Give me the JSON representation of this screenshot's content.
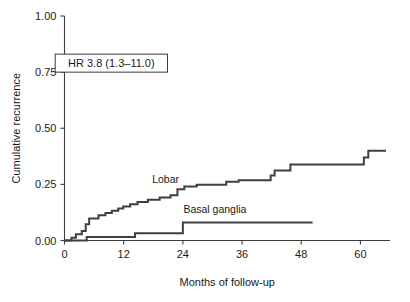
{
  "chart_data": {
    "type": "line",
    "title": "",
    "xlabel": "Months of follow-up",
    "ylabel": "Cumulative recurrence",
    "xlim": [
      0,
      66
    ],
    "ylim": [
      0.0,
      1.0
    ],
    "xticks": [
      0,
      12,
      24,
      36,
      48,
      60
    ],
    "xticklabels": [
      "0",
      "12",
      "24",
      "36",
      "48",
      "60"
    ],
    "yticks": [
      0.0,
      0.25,
      0.5,
      0.75,
      1.0
    ],
    "yticklabels": [
      "0.00",
      "0.25",
      "0.50",
      "0.75",
      "1.00"
    ],
    "grid": false,
    "legend_position": "inline-labels",
    "annotations": [
      {
        "name": "hazard-ratio",
        "text": "HR 3.8 (1.3–11.0)",
        "boxed": true,
        "x_months": 9.5,
        "y_value": 0.79
      }
    ],
    "series": [
      {
        "name": "Lobar",
        "label": "Lobar",
        "label_x_months": 20.5,
        "label_y_value": 0.255,
        "style": "step-post",
        "color": "#3f3f3f",
        "points": [
          {
            "x": 0.0,
            "y": 0.0
          },
          {
            "x": 1.0,
            "y": 0.0
          },
          {
            "x": 1.4,
            "y": 0.012
          },
          {
            "x": 2.0,
            "y": 0.012
          },
          {
            "x": 2.3,
            "y": 0.028
          },
          {
            "x": 3.2,
            "y": 0.028
          },
          {
            "x": 3.5,
            "y": 0.042
          },
          {
            "x": 4.0,
            "y": 0.042
          },
          {
            "x": 4.3,
            "y": 0.072
          },
          {
            "x": 4.8,
            "y": 0.072
          },
          {
            "x": 5.0,
            "y": 0.098
          },
          {
            "x": 6.6,
            "y": 0.098
          },
          {
            "x": 6.9,
            "y": 0.112
          },
          {
            "x": 8.0,
            "y": 0.112
          },
          {
            "x": 8.3,
            "y": 0.122
          },
          {
            "x": 9.3,
            "y": 0.122
          },
          {
            "x": 9.6,
            "y": 0.132
          },
          {
            "x": 10.6,
            "y": 0.132
          },
          {
            "x": 10.9,
            "y": 0.142
          },
          {
            "x": 11.6,
            "y": 0.142
          },
          {
            "x": 11.9,
            "y": 0.152
          },
          {
            "x": 13.0,
            "y": 0.152
          },
          {
            "x": 13.3,
            "y": 0.162
          },
          {
            "x": 14.5,
            "y": 0.162
          },
          {
            "x": 14.8,
            "y": 0.172
          },
          {
            "x": 16.6,
            "y": 0.172
          },
          {
            "x": 16.9,
            "y": 0.182
          },
          {
            "x": 19.0,
            "y": 0.182
          },
          {
            "x": 19.3,
            "y": 0.192
          },
          {
            "x": 21.2,
            "y": 0.192
          },
          {
            "x": 21.5,
            "y": 0.202
          },
          {
            "x": 22.6,
            "y": 0.202
          },
          {
            "x": 22.9,
            "y": 0.228
          },
          {
            "x": 24.0,
            "y": 0.228
          },
          {
            "x": 24.3,
            "y": 0.24
          },
          {
            "x": 26.5,
            "y": 0.24
          },
          {
            "x": 26.8,
            "y": 0.248
          },
          {
            "x": 32.5,
            "y": 0.248
          },
          {
            "x": 32.8,
            "y": 0.262
          },
          {
            "x": 35.0,
            "y": 0.262
          },
          {
            "x": 35.3,
            "y": 0.268
          },
          {
            "x": 41.5,
            "y": 0.268
          },
          {
            "x": 41.8,
            "y": 0.29
          },
          {
            "x": 42.3,
            "y": 0.29
          },
          {
            "x": 42.6,
            "y": 0.312
          },
          {
            "x": 45.5,
            "y": 0.312
          },
          {
            "x": 45.8,
            "y": 0.338
          },
          {
            "x": 60.4,
            "y": 0.338
          },
          {
            "x": 60.7,
            "y": 0.37
          },
          {
            "x": 61.3,
            "y": 0.37
          },
          {
            "x": 61.6,
            "y": 0.4
          },
          {
            "x": 65.2,
            "y": 0.4
          }
        ]
      },
      {
        "name": "Basal ganglia",
        "label": "Basal ganglia",
        "label_x_months": 30.5,
        "label_y_value": 0.122,
        "style": "step-post",
        "color": "#3f3f3f",
        "points": [
          {
            "x": 0.0,
            "y": 0.0
          },
          {
            "x": 4.3,
            "y": 0.0
          },
          {
            "x": 4.5,
            "y": 0.016
          },
          {
            "x": 14.0,
            "y": 0.016
          },
          {
            "x": 14.3,
            "y": 0.032
          },
          {
            "x": 23.8,
            "y": 0.032
          },
          {
            "x": 24.0,
            "y": 0.08
          },
          {
            "x": 50.3,
            "y": 0.08
          }
        ]
      }
    ]
  }
}
